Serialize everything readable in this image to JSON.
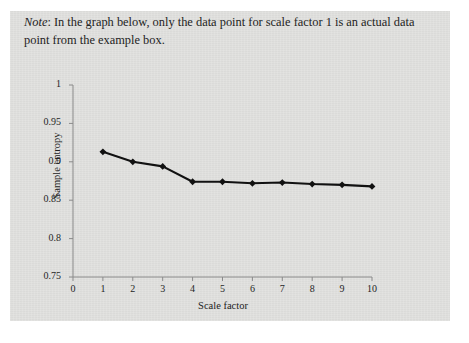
{
  "note": {
    "label": "Note",
    "separator": ": ",
    "text": "In the graph below, only the data point for scale factor 1 is an actual data point from the example box."
  },
  "chart_data": {
    "type": "line",
    "title": "",
    "xlabel": "Scale factor",
    "ylabel": "Sample entropy",
    "x": [
      1,
      2,
      3,
      4,
      5,
      6,
      7,
      8,
      9,
      10
    ],
    "values": [
      0.913,
      0.9,
      0.894,
      0.874,
      0.874,
      0.872,
      0.873,
      0.871,
      0.87,
      0.868
    ],
    "xlim": [
      0,
      10
    ],
    "ylim": [
      0.75,
      1
    ],
    "xticks": [
      "0",
      "1",
      "2",
      "3",
      "4",
      "5",
      "6",
      "7",
      "8",
      "9",
      "10"
    ],
    "yticks": [
      "0.75",
      "0.8",
      "0.85",
      "0.9",
      "0.95",
      "1"
    ],
    "ytick_values": [
      0.75,
      0.8,
      0.85,
      0.9,
      0.95,
      1
    ],
    "grid": false,
    "legend": null,
    "marker": "diamond",
    "line_color": "#111111",
    "marker_color": "#111111"
  },
  "colors": {
    "page_background": "#e2e2e0",
    "outer_background": "#ffffff",
    "axis": "#8a8a8a",
    "text": "#232323"
  }
}
